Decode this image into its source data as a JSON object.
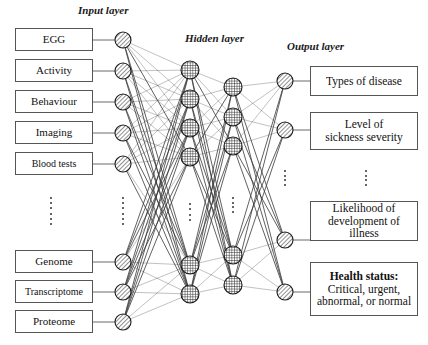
{
  "figure": {
    "width": 428,
    "height": 345,
    "background": "#ffffff",
    "line_color": "#555555",
    "node_stroke": "#1a1a1a"
  },
  "titles": {
    "input": "Input layer",
    "hidden": "Hidden layer",
    "output": "Output layer"
  },
  "inputs": [
    {
      "label": "EGG"
    },
    {
      "label": "Activity"
    },
    {
      "label": "Behaviour"
    },
    {
      "label": "Imaging"
    },
    {
      "label": "Blood tests"
    },
    {
      "label": "Genome"
    },
    {
      "label": "Transcriptome"
    },
    {
      "label": "Proteome"
    }
  ],
  "outputs": [
    {
      "lines": [
        "Types of disease"
      ],
      "bold_first": false
    },
    {
      "lines": [
        "Level of",
        "sickness severity"
      ],
      "bold_first": false
    },
    {
      "lines": [
        "Likelihood of",
        "development of illness"
      ],
      "bold_first": false
    },
    {
      "lines": [
        "Health status:",
        "Critical, urgent,",
        "abnormal, or normal"
      ],
      "bold_first": true
    }
  ],
  "layers": {
    "input_nodes": 8,
    "hidden1_nodes": 6,
    "hidden2_nodes": 5,
    "output_nodes": 4,
    "input_node_fill": "diagonal-hatch",
    "hidden_node_fill": "cross-hatch",
    "output_node_fill": "diagonal-hatch"
  },
  "ellipses": {
    "count": 5,
    "note": "vertical dots indicate omitted nodes/labels"
  },
  "chart_data": {
    "type": "diagram",
    "columns": [
      {
        "name": "input-labels",
        "x": 54,
        "items": [
          "EGG",
          "Activity",
          "Behaviour",
          "Imaging",
          "Blood tests",
          "⋮",
          "Genome",
          "Transcriptome",
          "Proteome"
        ]
      },
      {
        "name": "input-nodes",
        "x": 123,
        "node_y": [
          40,
          71,
          102,
          133,
          164,
          262,
          292,
          322
        ],
        "ellipsis_y": 210
      },
      {
        "name": "hidden-column-1",
        "x": 190,
        "node_y": [
          70,
          99,
          128,
          157,
          265,
          294
        ],
        "ellipsis_y": 212
      },
      {
        "name": "hidden-column-2",
        "x": 233,
        "node_y": [
          87,
          117,
          146,
          255,
          285
        ],
        "ellipsis_y": 205
      },
      {
        "name": "output-nodes",
        "x": 285,
        "node_y": [
          81,
          130,
          240,
          292
        ],
        "ellipsis_y": 180
      },
      {
        "name": "output-labels",
        "x": 364,
        "items": [
          "Types of disease",
          "Level of sickness severity",
          "⋮",
          "Likelihood of development of illness",
          "Health status: Critical, urgent, abnormal, or normal"
        ]
      }
    ]
  }
}
